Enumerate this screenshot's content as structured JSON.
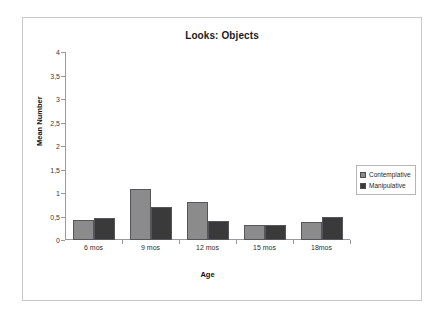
{
  "chart_data": {
    "type": "bar",
    "title": "Looks: Objects",
    "xlabel": "Age",
    "ylabel": "Mean Number",
    "categories": [
      "6 mos",
      "9 mos",
      "12 mos",
      "15 mos",
      "18mos"
    ],
    "series": [
      {
        "name": "Contemplative",
        "color": "#8b8b8b",
        "values": [
          0.42,
          1.08,
          0.8,
          0.33,
          0.38
        ]
      },
      {
        "name": "Manipulative",
        "color": "#3a3a3a",
        "values": [
          0.46,
          0.7,
          0.4,
          0.33,
          0.5
        ]
      }
    ],
    "ylim": [
      0,
      4
    ],
    "ytick_labels": [
      "4",
      "3,5",
      "3",
      "2,5",
      "2",
      "1,5",
      "1",
      "0,5",
      "0"
    ],
    "ytick_values": [
      4,
      3.5,
      3,
      2.5,
      2,
      1.5,
      1,
      0.5,
      0
    ],
    "grid": false,
    "legend_position": "right"
  },
  "legend": {
    "items": [
      {
        "label": "Contemplative"
      },
      {
        "label": "Manipulative"
      }
    ]
  }
}
